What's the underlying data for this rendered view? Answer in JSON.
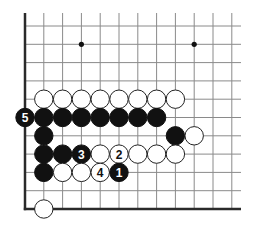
{
  "diagram": {
    "type": "go-board-fragment",
    "edges": [
      "left",
      "bottom"
    ],
    "columns_visible": 12,
    "rows_visible": 11,
    "star_points": [
      {
        "col": 3,
        "row": 9
      },
      {
        "col": 9,
        "row": 9
      },
      {
        "col": 3,
        "row": 3
      }
    ],
    "stones": [
      {
        "color": "white",
        "col": 1,
        "row": 6
      },
      {
        "color": "white",
        "col": 2,
        "row": 6
      },
      {
        "color": "white",
        "col": 3,
        "row": 6
      },
      {
        "color": "white",
        "col": 4,
        "row": 6
      },
      {
        "color": "white",
        "col": 5,
        "row": 6
      },
      {
        "color": "white",
        "col": 6,
        "row": 6
      },
      {
        "color": "white",
        "col": 7,
        "row": 6
      },
      {
        "color": "white",
        "col": 8,
        "row": 6
      },
      {
        "color": "black",
        "col": 0,
        "row": 5,
        "label": "5"
      },
      {
        "color": "black",
        "col": 1,
        "row": 5
      },
      {
        "color": "black",
        "col": 2,
        "row": 5
      },
      {
        "color": "black",
        "col": 3,
        "row": 5
      },
      {
        "color": "black",
        "col": 4,
        "row": 5
      },
      {
        "color": "black",
        "col": 5,
        "row": 5
      },
      {
        "color": "black",
        "col": 6,
        "row": 5
      },
      {
        "color": "black",
        "col": 7,
        "row": 5
      },
      {
        "color": "black",
        "col": 1,
        "row": 4
      },
      {
        "color": "black",
        "col": 8,
        "row": 4
      },
      {
        "color": "white",
        "col": 9,
        "row": 4
      },
      {
        "color": "black",
        "col": 1,
        "row": 3
      },
      {
        "color": "black",
        "col": 2,
        "row": 3
      },
      {
        "color": "black",
        "col": 3,
        "row": 3,
        "label": "3"
      },
      {
        "color": "white",
        "col": 4,
        "row": 3
      },
      {
        "color": "white",
        "col": 5,
        "row": 3,
        "label": "2"
      },
      {
        "color": "white",
        "col": 6,
        "row": 3
      },
      {
        "color": "white",
        "col": 7,
        "row": 3
      },
      {
        "color": "white",
        "col": 8,
        "row": 3
      },
      {
        "color": "black",
        "col": 1,
        "row": 2
      },
      {
        "color": "white",
        "col": 2,
        "row": 2
      },
      {
        "color": "white",
        "col": 3,
        "row": 2
      },
      {
        "color": "white",
        "col": 4,
        "row": 2,
        "label": "4"
      },
      {
        "color": "black",
        "col": 5,
        "row": 2,
        "label": "1"
      },
      {
        "color": "white",
        "col": 1,
        "row": 0
      }
    ],
    "colors": {
      "black_stone": "#111111",
      "white_stone": "#ffffff",
      "grid": "#8a8a8a",
      "edge": "#2a2a2a"
    }
  }
}
